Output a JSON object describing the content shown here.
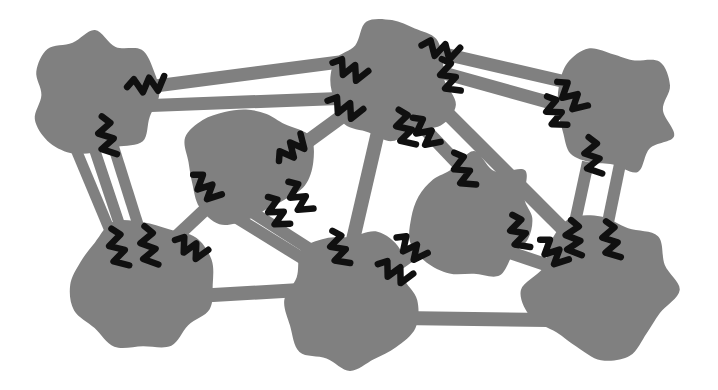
{
  "diagram": {
    "title": "Abstract node-link network diagram",
    "description": "Eight irregular gray blob nodes connected by thick gray bars; short black zigzag marks straddle many of the bar-to-node junctions.",
    "canvas": {
      "width": 718,
      "height": 390,
      "background": "#ffffff"
    },
    "style": {
      "node_fill": "#808080",
      "edge_fill": "#808080",
      "mark_color": "#101010",
      "outline": "none"
    },
    "counts": {
      "nodes_label": "8 nodes",
      "edges_label": "18 edges",
      "marks_label": "26 zigzag marks"
    },
    "nodes": [
      {
        "id": "n1",
        "name": "node-top-left",
        "cx": 95,
        "cy": 95,
        "rx": 62,
        "ry": 60,
        "seed": 11,
        "fill": "#808080"
      },
      {
        "id": "n2",
        "name": "node-upper-center",
        "cx": 246,
        "cy": 162,
        "rx": 62,
        "ry": 60,
        "seed": 23,
        "fill": "#808080"
      },
      {
        "id": "n3",
        "name": "node-top-middle",
        "cx": 392,
        "cy": 80,
        "rx": 62,
        "ry": 58,
        "seed": 37,
        "fill": "#808080"
      },
      {
        "id": "n4",
        "name": "node-top-right",
        "cx": 613,
        "cy": 110,
        "rx": 58,
        "ry": 60,
        "seed": 41,
        "fill": "#808080"
      },
      {
        "id": "n5",
        "name": "node-middle-right",
        "cx": 474,
        "cy": 218,
        "rx": 64,
        "ry": 60,
        "seed": 53,
        "fill": "#808080"
      },
      {
        "id": "n6",
        "name": "node-bottom-left",
        "cx": 143,
        "cy": 285,
        "rx": 72,
        "ry": 64,
        "seed": 67,
        "fill": "#808080"
      },
      {
        "id": "n7",
        "name": "node-bottom-middle",
        "cx": 350,
        "cy": 300,
        "rx": 66,
        "ry": 68,
        "seed": 79,
        "fill": "#808080"
      },
      {
        "id": "n8",
        "name": "node-bottom-right",
        "cx": 601,
        "cy": 290,
        "rx": 72,
        "ry": 68,
        "seed": 97,
        "fill": "#808080"
      }
    ],
    "edges": [
      {
        "id": "e1",
        "name": "edge-n1-n3-upper",
        "x1": 140,
        "y1": 88,
        "x2": 355,
        "y2": 60,
        "w": 13
      },
      {
        "id": "e2",
        "name": "edge-n1-n3-lower",
        "x1": 138,
        "y1": 106,
        "x2": 352,
        "y2": 98,
        "w": 13
      },
      {
        "id": "e3",
        "name": "edge-n1-n6-left",
        "x1": 72,
        "y1": 140,
        "x2": 118,
        "y2": 250,
        "w": 11
      },
      {
        "id": "e4",
        "name": "edge-n1-n6-mid",
        "x1": 92,
        "y1": 142,
        "x2": 128,
        "y2": 250,
        "w": 11
      },
      {
        "id": "e5",
        "name": "edge-n1-n6-right",
        "x1": 112,
        "y1": 142,
        "x2": 146,
        "y2": 250,
        "w": 11
      },
      {
        "id": "e6",
        "name": "edge-n2-n6",
        "x1": 210,
        "y1": 205,
        "x2": 160,
        "y2": 252,
        "w": 13
      },
      {
        "id": "e7",
        "name": "edge-n2-n7-left",
        "x1": 232,
        "y1": 215,
        "x2": 318,
        "y2": 268,
        "w": 12
      },
      {
        "id": "e8",
        "name": "edge-n2-n7-right",
        "x1": 252,
        "y1": 212,
        "x2": 330,
        "y2": 262,
        "w": 12
      },
      {
        "id": "e9",
        "name": "edge-n2-n3",
        "x1": 296,
        "y1": 150,
        "x2": 348,
        "y2": 112,
        "w": 14
      },
      {
        "id": "e10",
        "name": "edge-n3-n4-upper",
        "x1": 436,
        "y1": 52,
        "x2": 566,
        "y2": 82,
        "w": 13
      },
      {
        "id": "e11",
        "name": "edge-n3-n4-lower",
        "x1": 440,
        "y1": 72,
        "x2": 562,
        "y2": 106,
        "w": 13
      },
      {
        "id": "e12",
        "name": "edge-n3-n5",
        "x1": 420,
        "y1": 124,
        "x2": 462,
        "y2": 168,
        "w": 13
      },
      {
        "id": "e13",
        "name": "edge-n3-n7",
        "x1": 378,
        "y1": 132,
        "x2": 352,
        "y2": 244,
        "w": 14
      },
      {
        "id": "e14",
        "name": "edge-n3-n8",
        "x1": 442,
        "y1": 108,
        "x2": 572,
        "y2": 238,
        "w": 14
      },
      {
        "id": "e15",
        "name": "edge-n4-n8-left",
        "x1": 588,
        "y1": 162,
        "x2": 572,
        "y2": 236,
        "w": 12
      },
      {
        "id": "e16",
        "name": "edge-n4-n8-right",
        "x1": 620,
        "y1": 164,
        "x2": 606,
        "y2": 232,
        "w": 12
      },
      {
        "id": "e17",
        "name": "edge-n5-n7",
        "x1": 414,
        "y1": 252,
        "x2": 372,
        "y2": 282,
        "w": 14
      },
      {
        "id": "e18",
        "name": "edge-n6-n7",
        "x1": 196,
        "y1": 296,
        "x2": 300,
        "y2": 290,
        "w": 14
      },
      {
        "id": "e19",
        "name": "edge-n7-n8",
        "x1": 400,
        "y1": 318,
        "x2": 548,
        "y2": 320,
        "w": 14
      },
      {
        "id": "e20",
        "name": "edge-n5-n8",
        "x1": 508,
        "y1": 252,
        "x2": 556,
        "y2": 268,
        "w": 13
      }
    ],
    "marks": [
      {
        "id": "m1",
        "name": "zigzag-mark-n1-e1",
        "x": 146,
        "y": 85,
        "angle": -6,
        "len": 38,
        "amp": 7
      },
      {
        "id": "m2",
        "name": "zigzag-mark-n1-e4",
        "x": 106,
        "y": 136,
        "angle": 78,
        "len": 40,
        "amp": 7
      },
      {
        "id": "m3",
        "name": "zigzag-mark-n6-e3",
        "x": 117,
        "y": 248,
        "angle": 74,
        "len": 40,
        "amp": 7
      },
      {
        "id": "m4",
        "name": "zigzag-mark-n6-e5",
        "x": 148,
        "y": 246,
        "angle": 80,
        "len": 40,
        "amp": 7
      },
      {
        "id": "m5",
        "name": "zigzag-mark-n6-e6",
        "x": 190,
        "y": 248,
        "angle": 28,
        "len": 34,
        "amp": 7
      },
      {
        "id": "m6",
        "name": "zigzag-mark-n2-e6",
        "x": 205,
        "y": 187,
        "angle": 46,
        "len": 34,
        "amp": 7
      },
      {
        "id": "m7",
        "name": "zigzag-mark-n2-e7",
        "x": 298,
        "y": 197,
        "angle": 58,
        "len": 36,
        "amp": 7
      },
      {
        "id": "m8",
        "name": "zigzag-mark-n2-e9",
        "x": 292,
        "y": 150,
        "angle": -40,
        "len": 34,
        "amp": 7
      },
      {
        "id": "m9",
        "name": "zigzag-mark-n2-e8",
        "x": 276,
        "y": 212,
        "angle": 62,
        "len": 34,
        "amp": 7
      },
      {
        "id": "m10",
        "name": "zigzag-mark-n3-e1",
        "x": 349,
        "y": 70,
        "angle": 24,
        "len": 36,
        "amp": 7
      },
      {
        "id": "m11",
        "name": "zigzag-mark-n3-e2",
        "x": 344,
        "y": 108,
        "angle": 24,
        "len": 36,
        "amp": 7
      },
      {
        "id": "m12",
        "name": "zigzag-mark-n3-e10",
        "x": 440,
        "y": 50,
        "angle": 14,
        "len": 38,
        "amp": 7
      },
      {
        "id": "m13",
        "name": "zigzag-mark-n3-e11",
        "x": 448,
        "y": 76,
        "angle": 70,
        "len": 36,
        "amp": 7
      },
      {
        "id": "m14",
        "name": "zigzag-mark-n3-e13",
        "x": 404,
        "y": 128,
        "angle": 74,
        "len": 38,
        "amp": 7
      },
      {
        "id": "m15",
        "name": "zigzag-mark-n3-e12",
        "x": 424,
        "y": 132,
        "angle": 52,
        "len": 36,
        "amp": 7
      },
      {
        "id": "m16",
        "name": "zigzag-mark-n4-e10",
        "x": 570,
        "y": 96,
        "angle": 48,
        "len": 38,
        "amp": 7
      },
      {
        "id": "m17",
        "name": "zigzag-mark-n4-e15",
        "x": 592,
        "y": 156,
        "angle": 80,
        "len": 38,
        "amp": 7
      },
      {
        "id": "m18",
        "name": "zigzag-mark-n5-e12",
        "x": 462,
        "y": 170,
        "angle": 66,
        "len": 38,
        "amp": 7
      },
      {
        "id": "m19",
        "name": "zigzag-mark-n5-e14",
        "x": 518,
        "y": 232,
        "angle": 72,
        "len": 36,
        "amp": 7
      },
      {
        "id": "m20",
        "name": "zigzag-mark-n5-e17",
        "x": 410,
        "y": 248,
        "angle": 38,
        "len": 34,
        "amp": 7
      },
      {
        "id": "m21",
        "name": "zigzag-mark-n7-e13",
        "x": 338,
        "y": 248,
        "angle": 72,
        "len": 36,
        "amp": 7
      },
      {
        "id": "m22",
        "name": "zigzag-mark-n7-e17",
        "x": 394,
        "y": 272,
        "angle": 26,
        "len": 36,
        "amp": 7
      },
      {
        "id": "m23",
        "name": "zigzag-mark-n8-e14",
        "x": 552,
        "y": 252,
        "angle": 46,
        "len": 34,
        "amp": 7
      },
      {
        "id": "m24",
        "name": "zigzag-mark-n8-e16",
        "x": 610,
        "y": 240,
        "angle": 78,
        "len": 38,
        "amp": 7
      },
      {
        "id": "m25",
        "name": "zigzag-mark-n8-e15",
        "x": 573,
        "y": 238,
        "angle": 84,
        "len": 36,
        "amp": 7
      },
      {
        "id": "m26",
        "name": "zigzag-mark-n4-e11",
        "x": 554,
        "y": 112,
        "angle": 66,
        "len": 34,
        "amp": 7
      }
    ]
  }
}
